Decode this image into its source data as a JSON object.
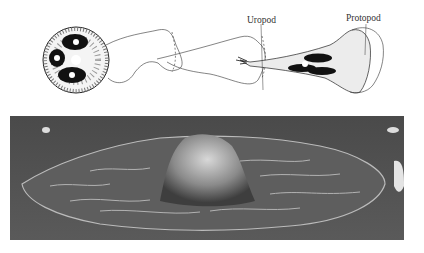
{
  "figure": {
    "labels": {
      "uropod": "Uropod",
      "protopod": "Protopod"
    },
    "panels": [
      {
        "name": "line-drawing",
        "description": "Drawing of cell sequence from rounded to elongated migrating cell"
      },
      {
        "name": "sem-micrograph",
        "description": "Scanning electron micrograph of spread cell on substrate"
      }
    ]
  }
}
